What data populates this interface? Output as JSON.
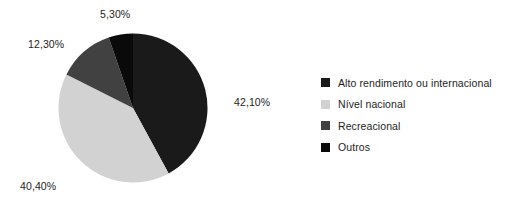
{
  "chart_data": {
    "type": "pie",
    "title": "",
    "subtitle": "",
    "xlabel": "",
    "ylabel": "",
    "grid": false,
    "legend_position": "right",
    "value_suffix": "%",
    "decimal_separator": ",",
    "categories": [
      "Alto rendimento ou internacional",
      "Nível nacional",
      "Recreacional",
      "Outros"
    ],
    "values": [
      42.1,
      40.4,
      12.3,
      5.3
    ],
    "labels": [
      "42,10%",
      "40,40%",
      "12,30%",
      "5,30%"
    ],
    "colors": [
      "#1a1a1a",
      "#d2d2d2",
      "#414141",
      "#0a0a0a"
    ],
    "start_angle_deg": 0,
    "direction": "clockwise",
    "slices": [
      {
        "name": "Alto rendimento ou internacional",
        "value": 42.1,
        "label": "42,10%",
        "color": "#1a1a1a"
      },
      {
        "name": "Nível nacional",
        "value": 40.4,
        "label": "40,40%",
        "color": "#d2d2d2"
      },
      {
        "name": "Recreacional",
        "value": 12.3,
        "label": "12,30%",
        "color": "#414141"
      },
      {
        "name": "Outros",
        "value": 5.3,
        "label": "5,30%",
        "color": "#0a0a0a"
      }
    ]
  },
  "legend": {
    "items": [
      {
        "label": "Alto rendimento ou internacional",
        "color": "#1a1a1a"
      },
      {
        "label": "Nível nacional",
        "color": "#d2d2d2"
      },
      {
        "label": "Recreacional",
        "color": "#414141"
      },
      {
        "label": "Outros",
        "color": "#0a0a0a"
      }
    ]
  },
  "callouts": {
    "outros": "5,30%",
    "recreacional": "12,30%",
    "alto": "42,10%",
    "nivel": "40,40%"
  }
}
